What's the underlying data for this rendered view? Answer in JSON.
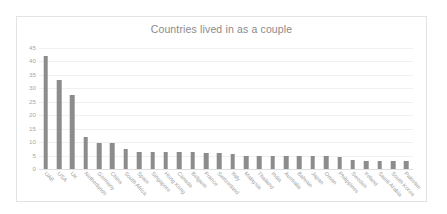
{
  "chart_data": {
    "type": "bar",
    "title": "Countries lived in as a couple",
    "xlabel": "",
    "ylabel": "",
    "ylim": [
      0,
      45
    ],
    "yticks": [
      0,
      5,
      10,
      15,
      20,
      25,
      30,
      35,
      40,
      45
    ],
    "grid": true,
    "legend": "none",
    "bar_color": "#8c8c8c",
    "title_color": "#8a8a8a",
    "tick_color": "#a8a8a8",
    "categories": [
      "UAE",
      "USA",
      "UK",
      "Netherlands",
      "Germany",
      "China",
      "South Africa",
      "Spain",
      "Singapore",
      "Hong Kong",
      "Canada",
      "Belgium",
      "France",
      "Switzerland",
      "Italy",
      "Malaysia",
      "Thailand",
      "India",
      "Australia",
      "Bahrain",
      "Japan",
      "Oman",
      "Philippines",
      "Sweden",
      "Ireland",
      "Saudi Arabia",
      "South Korea",
      "Pakistan"
    ],
    "values": [
      42,
      33,
      27.5,
      12,
      9.5,
      9.5,
      7.5,
      6.5,
      6.5,
      6.5,
      6.5,
      6.5,
      6,
      6,
      5.5,
      5,
      5,
      5,
      5,
      5,
      5,
      5,
      4.5,
      3.5,
      3,
      3,
      3,
      3
    ]
  }
}
